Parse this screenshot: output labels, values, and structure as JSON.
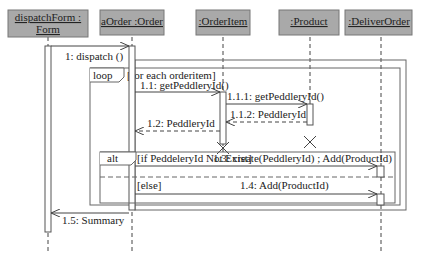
{
  "diagram": {
    "type": "sequence",
    "participants": [
      {
        "id": "form",
        "label_line1": "dispatchForm :",
        "label_line2": "Form"
      },
      {
        "id": "order",
        "label": "aOrder :Order"
      },
      {
        "id": "orderitem",
        "label": ":OrderItem"
      },
      {
        "id": "product",
        "label": ":Product"
      },
      {
        "id": "deliver",
        "label": ":DeliverOrder"
      }
    ],
    "fragments": {
      "loop": {
        "operator": "loop",
        "guard": "[for each orderitem]"
      },
      "alt": {
        "operator": "alt",
        "guard1": "[if PeddeleryId Not Exist]",
        "guard2": "[else]"
      }
    },
    "messages": [
      {
        "label": "1: dispatch ()",
        "from": "form",
        "to": "order",
        "kind": "call"
      },
      {
        "label": "1.1: getPeddleryId()",
        "from": "order",
        "to": "orderitem",
        "kind": "call"
      },
      {
        "label": "1.1.1: getPeddleryId()",
        "from": "orderitem",
        "to": "product",
        "kind": "call"
      },
      {
        "label": "1.1.2: PeddleryId",
        "from": "product",
        "to": "orderitem",
        "kind": "return"
      },
      {
        "label": "1.2: PeddleryId",
        "from": "orderitem",
        "to": "order",
        "kind": "return"
      },
      {
        "label": "1.3: create(PeddleryId) ; Add(ProductId)",
        "from": "order",
        "to": "deliver",
        "kind": "call"
      },
      {
        "label": "1.4: Add(ProductId)",
        "from": "order",
        "to": "deliver",
        "kind": "call"
      },
      {
        "label": "1.5: Summary",
        "from": "order",
        "to": "form",
        "kind": "return"
      }
    ]
  }
}
